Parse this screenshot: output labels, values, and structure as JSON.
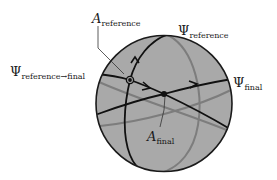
{
  "diagram": {
    "labels": {
      "a_reference": {
        "symbol": "A",
        "subscript": "reference"
      },
      "psi_reference": {
        "symbol": "Ψ",
        "subscript": "reference"
      },
      "psi_reference_to_final": {
        "symbol": "Ψ",
        "subscript": "reference→final"
      },
      "psi_final": {
        "symbol": "Ψ",
        "subscript": "final"
      },
      "a_final": {
        "symbol": "A",
        "subscript": "final"
      }
    },
    "colors": {
      "sphere_fill": "#a9a9a9",
      "sphere_outline": "#1a1a1a",
      "front_curve": "#111111",
      "back_curve": "#7d7d7d",
      "leader_line": "#333333",
      "text": "#1a1a1a"
    },
    "points": {
      "reference": {
        "x": 130,
        "y": 80,
        "style": "ringed-dot"
      },
      "final": {
        "x": 164,
        "y": 94,
        "style": "solid-dot"
      }
    }
  }
}
